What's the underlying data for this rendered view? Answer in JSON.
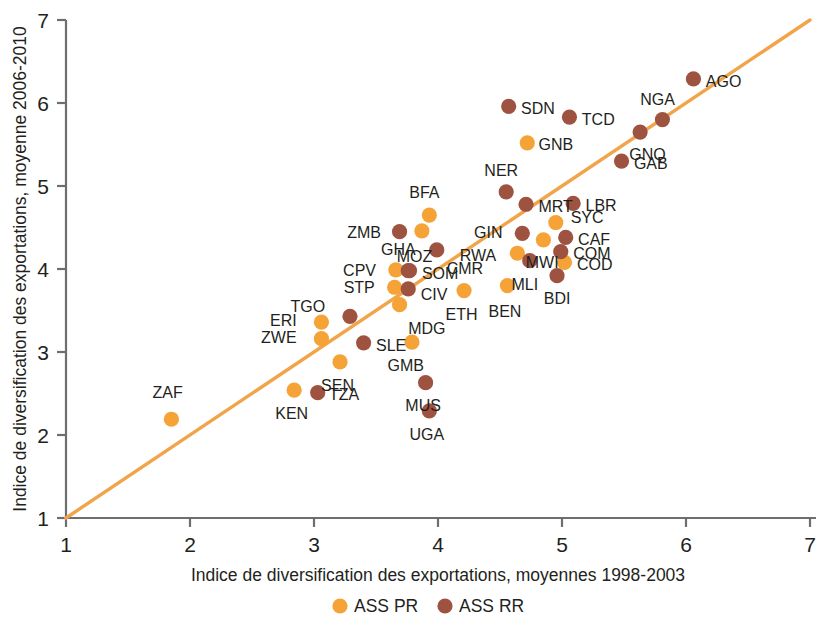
{
  "chart_data": {
    "type": "scatter",
    "title": "",
    "xlabel": "Indice de diversification des exportations, moyennes 1998-2003",
    "ylabel": "Indice de diversification des exportations, moyenne 2006-2010",
    "xlim": [
      1,
      7
    ],
    "ylim": [
      1,
      7
    ],
    "xticks": [
      "1",
      "2",
      "3",
      "4",
      "5",
      "6",
      "7"
    ],
    "yticks": [
      "1",
      "2",
      "3",
      "4",
      "5",
      "6",
      "7"
    ],
    "grid": false,
    "legend_position": "bottom-center",
    "colors": {
      "ASS PR": "#F5A337",
      "ASS RR": "#9E5341",
      "reference_line": "#F2A44B",
      "axis": "#6D6E70"
    },
    "legend": [
      {
        "label": "ASS PR",
        "color": "#F5A337"
      },
      {
        "label": "ASS RR",
        "color": "#9E5341"
      }
    ],
    "reference_line": {
      "from": [
        1,
        1
      ],
      "to": [
        7.05,
        7.05
      ],
      "note": "45 degree line"
    },
    "series": [
      {
        "name": "ASS PR",
        "color": "#F5A337",
        "points": [
          {
            "label": "ZAF",
            "x": 1.85,
            "y": 2.19,
            "lx": -0.03,
            "ly": 0.33,
            "anchor": "middle"
          },
          {
            "label": "KEN",
            "x": 2.84,
            "y": 2.54,
            "lx": -0.02,
            "ly": -0.28,
            "anchor": "middle"
          },
          {
            "label": "ERI",
            "x": 3.06,
            "y": 3.36,
            "lx": -0.2,
            "ly": 0.02,
            "anchor": "end"
          },
          {
            "label": "ZWE",
            "x": 3.06,
            "y": 3.16,
            "lx": -0.2,
            "ly": 0.02,
            "anchor": "end"
          },
          {
            "label": "SEN",
            "x": 3.21,
            "y": 2.88,
            "lx": -0.02,
            "ly": -0.28,
            "anchor": "middle"
          },
          {
            "label": "GMB",
            "x": 3.79,
            "y": 3.12,
            "lx": -0.05,
            "ly": -0.28,
            "anchor": "middle"
          },
          {
            "label": "MDG",
            "x": 3.69,
            "y": 3.57,
            "lx": 0.07,
            "ly": -0.28,
            "anchor": "start"
          },
          {
            "label": "STP",
            "x": 3.65,
            "y": 3.78,
            "lx": -0.16,
            "ly": 0.0,
            "anchor": "end"
          },
          {
            "label": "CPV",
            "x": 3.66,
            "y": 3.99,
            "lx": -0.16,
            "ly": 0.0,
            "anchor": "end"
          },
          {
            "label": "BFA",
            "x": 3.93,
            "y": 4.65,
            "lx": -0.04,
            "ly": 0.28,
            "anchor": "middle"
          },
          {
            "label": "MOZ",
            "x": 3.87,
            "y": 4.46,
            "lx": -0.06,
            "ly": -0.3,
            "anchor": "middle"
          },
          {
            "label": "ETH",
            "x": 4.21,
            "y": 3.74,
            "lx": -0.02,
            "ly": -0.28,
            "anchor": "middle"
          },
          {
            "label": "BEN",
            "x": 4.56,
            "y": 3.8,
            "lx": -0.02,
            "ly": -0.3,
            "anchor": "middle"
          },
          {
            "label": "RWA",
            "x": 4.64,
            "y": 4.19,
            "lx": -0.17,
            "ly": -0.02,
            "anchor": "end"
          },
          {
            "label": "GNB",
            "x": 4.72,
            "y": 5.52,
            "lx": 0.09,
            "ly": -0.01,
            "anchor": "start"
          },
          {
            "label": "MWI",
            "x": 4.85,
            "y": 4.35,
            "lx": -0.01,
            "ly": -0.26,
            "anchor": "middle"
          },
          {
            "label": "SYC",
            "x": 4.95,
            "y": 4.56,
            "lx": 0.12,
            "ly": 0.07,
            "anchor": "start"
          },
          {
            "label": "COD",
            "x": 5.02,
            "y": 4.08,
            "lx": 0.1,
            "ly": -0.02,
            "anchor": "start"
          }
        ]
      },
      {
        "name": "ASS RR",
        "color": "#9E5341",
        "points": [
          {
            "label": "TZA",
            "x": 3.03,
            "y": 2.51,
            "lx": 0.09,
            "ly": -0.01,
            "anchor": "start"
          },
          {
            "label": "SLE",
            "x": 3.4,
            "y": 3.11,
            "lx": 0.1,
            "ly": -0.02,
            "anchor": "start"
          },
          {
            "label": "TGO",
            "x": 3.29,
            "y": 3.43,
            "lx": -0.2,
            "ly": 0.12,
            "anchor": "end"
          },
          {
            "label": "GHA",
            "x": 3.76,
            "y": 3.98,
            "lx": -0.08,
            "ly": 0.26,
            "anchor": "middle"
          },
          {
            "label": "SOM",
            "x": 3.77,
            "y": 3.98,
            "lx": 0.1,
            "ly": -0.03,
            "anchor": "start"
          },
          {
            "label": "CIV",
            "x": 3.76,
            "y": 3.76,
            "lx": 0.1,
            "ly": -0.06,
            "anchor": "start"
          },
          {
            "label": "MUS",
            "x": 3.9,
            "y": 2.63,
            "lx": -0.02,
            "ly": -0.27,
            "anchor": "middle"
          },
          {
            "label": "UGA",
            "x": 3.93,
            "y": 2.29,
            "lx": -0.02,
            "ly": -0.28,
            "anchor": "middle"
          },
          {
            "label": "ZMB",
            "x": 3.69,
            "y": 4.45,
            "lx": -0.15,
            "ly": -0.01,
            "anchor": "end"
          },
          {
            "label": "CMR",
            "x": 3.99,
            "y": 4.23,
            "lx": 0.08,
            "ly": -0.22,
            "anchor": "start"
          },
          {
            "label": "NER",
            "x": 4.55,
            "y": 4.93,
            "lx": -0.04,
            "ly": 0.26,
            "anchor": "middle"
          },
          {
            "label": "SDN",
            "x": 4.57,
            "y": 5.96,
            "lx": 0.1,
            "ly": -0.02,
            "anchor": "start"
          },
          {
            "label": "MRT",
            "x": 4.71,
            "y": 4.78,
            "lx": 0.1,
            "ly": -0.02,
            "anchor": "start"
          },
          {
            "label": "GIN",
            "x": 4.68,
            "y": 4.43,
            "lx": -0.16,
            "ly": 0.02,
            "anchor": "end"
          },
          {
            "label": "MLI",
            "x": 4.74,
            "y": 4.1,
            "lx": -0.04,
            "ly": -0.28,
            "anchor": "middle"
          },
          {
            "label": "CAF",
            "x": 5.03,
            "y": 4.38,
            "lx": 0.1,
            "ly": -0.02,
            "anchor": "start"
          },
          {
            "label": "COM",
            "x": 4.99,
            "y": 4.21,
            "lx": 0.1,
            "ly": -0.02,
            "anchor": "start"
          },
          {
            "label": "BDI",
            "x": 4.96,
            "y": 3.92,
            "lx": 0.0,
            "ly": -0.27,
            "anchor": "middle"
          },
          {
            "label": "LBR",
            "x": 5.09,
            "y": 4.79,
            "lx": 0.1,
            "ly": -0.02,
            "anchor": "start"
          },
          {
            "label": "TCD",
            "x": 5.06,
            "y": 5.83,
            "lx": 0.1,
            "ly": -0.02,
            "anchor": "start"
          },
          {
            "label": "GAB",
            "x": 5.48,
            "y": 5.3,
            "lx": 0.1,
            "ly": -0.02,
            "anchor": "start"
          },
          {
            "label": "GNQ",
            "x": 5.63,
            "y": 5.65,
            "lx": 0.06,
            "ly": -0.26,
            "anchor": "middle"
          },
          {
            "label": "NGA",
            "x": 5.81,
            "y": 5.8,
            "lx": -0.04,
            "ly": 0.25,
            "anchor": "middle"
          },
          {
            "label": "AGO",
            "x": 6.06,
            "y": 6.29,
            "lx": 0.1,
            "ly": -0.02,
            "anchor": "start"
          }
        ]
      }
    ]
  }
}
